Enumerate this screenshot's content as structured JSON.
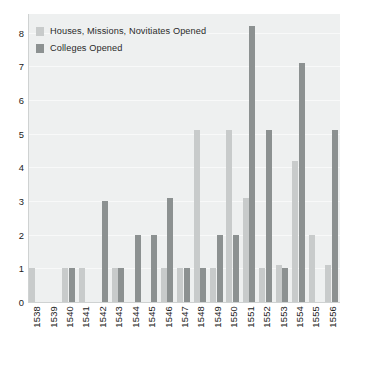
{
  "chart_data": {
    "type": "bar",
    "title": "",
    "subtitle": "",
    "xlabel": "",
    "ylabel": "",
    "ylim": [
      0,
      8.55
    ],
    "yticks": [
      0,
      1,
      2,
      3,
      4,
      5,
      6,
      7,
      8
    ],
    "ytick_labels": [
      "0",
      "1",
      "2",
      "3",
      "4",
      "5",
      "6",
      "7",
      "8"
    ],
    "grid": true,
    "legend_position": "top-left",
    "categories": [
      "1538",
      "1539",
      "1540",
      "1541",
      "1542",
      "1543",
      "1544",
      "1545",
      "1546",
      "1547",
      "1548",
      "1549",
      "1550",
      "1551",
      "1552",
      "1553",
      "1554",
      "1555",
      "1556"
    ],
    "series": [
      {
        "name": "Houses, Missions, Novitiates Opened",
        "color": "#c8cbcb",
        "values": [
          1,
          0,
          1,
          1,
          0,
          1,
          0,
          0,
          1,
          1,
          5.1,
          1,
          5.1,
          3.1,
          1,
          1.1,
          4.2,
          2,
          1.1
        ]
      },
      {
        "name": "Colleges Opened",
        "color": "#8c9191",
        "values": [
          0,
          0,
          1,
          0,
          3,
          1,
          2,
          2,
          3.1,
          1,
          1,
          2,
          2,
          8.2,
          5.1,
          1,
          7.1,
          0,
          5.1
        ]
      }
    ]
  },
  "legend": {
    "items": [
      {
        "label": "Houses, Missions, Novitiates Opened",
        "color": "#c8cbcb"
      },
      {
        "label": "Colleges Opened",
        "color": "#8c9191"
      }
    ]
  },
  "colors": {
    "plot_background": "#eef0f0",
    "gridline": "#f8f9f9",
    "axis": "#cfd2d2",
    "text": "#222222",
    "series_light": "#c8cbcb",
    "series_dark": "#8c9191"
  }
}
